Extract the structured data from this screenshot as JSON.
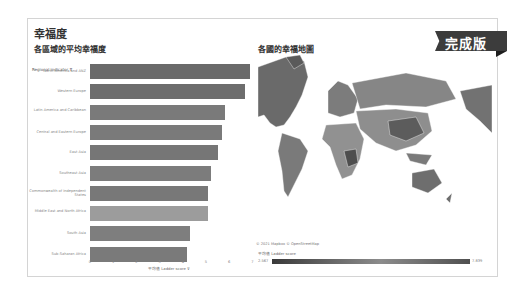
{
  "dashboard": {
    "title": "幸福度",
    "badge": "完成版"
  },
  "bar_panel": {
    "title": "各區域的平均幸福度",
    "row_header": "Regional indicator",
    "axis_title": "平均值 Ladder score"
  },
  "map_panel": {
    "title": "各國的幸福地圖",
    "credit": "© 2021 Mapbox © OpenStreetMap",
    "legend_title": "平均值 Ladder score",
    "legend_min": "2.567",
    "legend_max": "7.839"
  },
  "chart_data": [
    {
      "type": "bar",
      "orientation": "horizontal",
      "title": "各區域的平均幸福度",
      "xlabel": "平均值 Ladder score",
      "ylabel": "Regional indicator",
      "categories": [
        "North America and ANZ",
        "Western Europe",
        "Latin America and Caribbean",
        "Central and Eastern Europe",
        "East Asia",
        "Southeast Asia",
        "Commonwealth of Independent States",
        "Middle East and North Africa",
        "South Asia",
        "Sub-Saharan Africa"
      ],
      "values": [
        6.9,
        6.7,
        5.8,
        5.7,
        5.5,
        5.2,
        5.1,
        5.1,
        4.3,
        4.2
      ],
      "xlim": [
        0,
        7
      ],
      "xticks": [
        "0",
        "1",
        "2",
        "3",
        "4",
        "5",
        "6",
        "7"
      ],
      "grid": false
    },
    {
      "type": "heatmap",
      "subtype": "choropleth",
      "title": "各國的幸福地圖",
      "legend": "平均值 Ladder score",
      "range": [
        2.567,
        7.839
      ]
    }
  ]
}
